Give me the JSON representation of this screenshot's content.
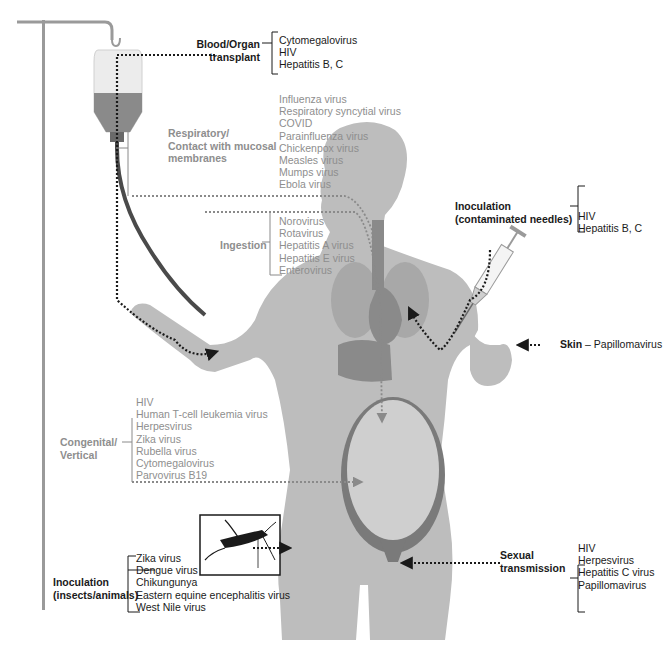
{
  "diagram": {
    "colors": {
      "body_fill": "#bdbdbd",
      "organ_fill": "#8a8a8a",
      "dark_label": "#1a1a1a",
      "grey_label": "#8e8e8e",
      "arrow_dark": "#1a1a1a",
      "arrow_grey": "#8a8a8a"
    },
    "routes": [
      {
        "id": "blood_organ",
        "label_line1": "Blood/Organ",
        "label_line2": "transplant",
        "style": "dark",
        "viruses": [
          "Cytomegalovirus",
          "HIV",
          "Hepatitis B, C"
        ]
      },
      {
        "id": "respiratory",
        "label_line1": "Respiratory/",
        "label_line2": "Contact with mucosal",
        "label_line3": "membranes",
        "style": "grey",
        "viruses": [
          "Influenza virus",
          "Respiratory syncytial virus",
          "COVID",
          "Parainfluenza virus",
          "Chickenpox virus",
          "Measles virus",
          "Mumps virus",
          "Ebola virus"
        ]
      },
      {
        "id": "ingestion",
        "label_line1": "Ingestion",
        "style": "grey",
        "viruses": [
          "Norovirus",
          "Rotavirus",
          "Hepatitis A virus",
          "Hepatitis E virus",
          "Enterovirus"
        ]
      },
      {
        "id": "inoculation_needles",
        "label_line1": "Inoculation",
        "label_line2": "(contaminated needles)",
        "style": "dark",
        "viruses": [
          "HIV",
          "Hepatitis B, C"
        ]
      },
      {
        "id": "skin",
        "label_bold": "Skin",
        "label_rest": " – Papillomavirus",
        "style": "dark",
        "viruses": [
          "Papillomavirus"
        ]
      },
      {
        "id": "congenital",
        "label_line1": "Congenital/",
        "label_line2": "Vertical",
        "style": "grey",
        "viruses": [
          "HIV",
          "Human T-cell leukemia virus",
          "Herpesvirus",
          "Zika virus",
          "Rubella virus",
          "Cytomegalovirus",
          "Parvovirus B19"
        ]
      },
      {
        "id": "inoculation_insects",
        "label_line1": "Inoculation",
        "label_line2": "(insects/animals)",
        "style": "dark",
        "viruses": [
          "Zika virus",
          "Dengue virus",
          "Chikungunya",
          "Eastern equine encephalitis virus",
          "West Nile virus"
        ]
      },
      {
        "id": "sexual",
        "label_line1": "Sexual",
        "label_line2": "transmission",
        "style": "dark",
        "viruses": [
          "HIV",
          "Herpesvirus",
          "Hepatitis C virus",
          "Papillomavirus"
        ]
      }
    ]
  }
}
